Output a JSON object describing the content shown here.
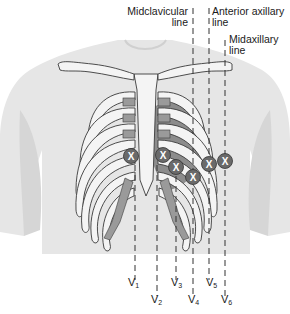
{
  "reference_lines": [
    {
      "id": "midclavicular",
      "label_line1": "Midclavicular",
      "label_line2": "line",
      "x": 193
    },
    {
      "id": "anterior-axillary",
      "label_line1": "Anterior axillary",
      "label_line2": "line",
      "x": 209
    },
    {
      "id": "midaxillary",
      "label_line1": "Midaxillary",
      "label_line2": "line",
      "x": 225
    }
  ],
  "electrodes": [
    {
      "lead": "V",
      "sub": "1",
      "cx": 131,
      "cy": 156,
      "label_x": 128,
      "label_y": 283,
      "line_x": 135
    },
    {
      "lead": "V",
      "sub": "2",
      "cx": 163,
      "cy": 155,
      "label_x": 153,
      "label_y": 299,
      "line_x": 157
    },
    {
      "lead": "V",
      "sub": "3",
      "cx": 176,
      "cy": 167,
      "label_x": 172,
      "label_y": 283,
      "line_x": 176
    },
    {
      "lead": "V",
      "sub": "4",
      "cx": 193,
      "cy": 177,
      "label_x": 190,
      "label_y": 299,
      "line_x": 193
    },
    {
      "lead": "V",
      "sub": "5",
      "cx": 209,
      "cy": 164,
      "label_x": 206,
      "label_y": 283,
      "line_x": 209
    },
    {
      "lead": "V",
      "sub": "6",
      "cx": 225,
      "cy": 161,
      "label_x": 222,
      "label_y": 299,
      "line_x": 225
    }
  ],
  "electrode_marker": "X",
  "colors": {
    "skin": "#e6e6e6",
    "skin_shadow": "#d4d4d4",
    "bone": "#f4f4f4",
    "bone_outline": "#3a3a3a",
    "cartilage": "#9a9a9a",
    "heart": "#6e6e6e",
    "electrode": "#6a6a6a",
    "electrode_text": "#ffffff",
    "dash": "#333333"
  }
}
